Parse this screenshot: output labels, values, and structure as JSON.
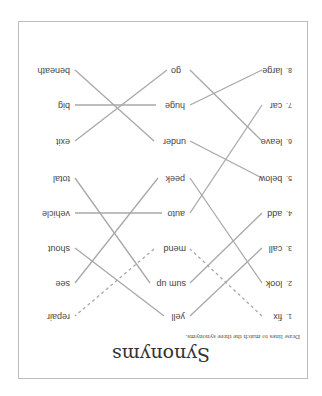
{
  "title": "Synonyms",
  "instruction": "Draw lines to match the three synonyms.",
  "orientation": "rotated 180°",
  "colors": {
    "line": "#a8a8a8",
    "text": "#444444",
    "frame": "#bdbdbd"
  },
  "column1": [
    {
      "num": "1.",
      "word": "fix"
    },
    {
      "num": "2.",
      "word": "look"
    },
    {
      "num": "3.",
      "word": "call"
    },
    {
      "num": "4.",
      "word": "add"
    },
    {
      "num": "5.",
      "word": "below"
    },
    {
      "num": "6.",
      "word": "leave"
    },
    {
      "num": "7.",
      "word": "car"
    },
    {
      "num": "8.",
      "word": "large"
    }
  ],
  "column2": [
    "yell",
    "sum up",
    "mend",
    "auto",
    "peek",
    "under",
    "huge",
    "go"
  ],
  "column3": [
    "repair",
    "see",
    "shout",
    "vehicle",
    "total",
    "exit",
    "big",
    "beneath"
  ],
  "connections": [
    {
      "from": "fix",
      "mid": "mend",
      "to": "repair",
      "style": "dashed"
    },
    {
      "from": "look",
      "mid": "peek",
      "to": "see",
      "style": "solid"
    },
    {
      "from": "call",
      "mid": "yell",
      "to": "shout",
      "style": "solid"
    },
    {
      "from": "add",
      "mid": "sum up",
      "to": "total",
      "style": "solid"
    },
    {
      "from": "below",
      "mid": "under",
      "to": "beneath",
      "style": "solid"
    },
    {
      "from": "leave",
      "mid": "go",
      "to": "exit",
      "style": "solid"
    },
    {
      "from": "car",
      "mid": "auto",
      "to": "vehicle",
      "style": "solid"
    },
    {
      "from": "large",
      "mid": "huge",
      "to": "big",
      "style": "solid"
    }
  ]
}
